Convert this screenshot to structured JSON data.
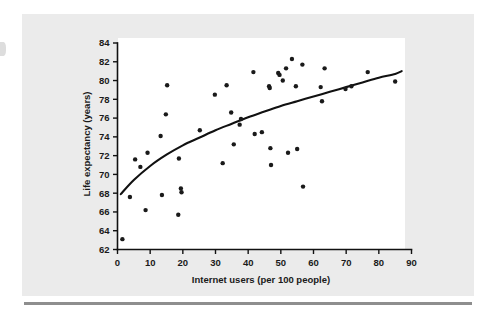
{
  "figure": {
    "background_color": "#ebebeb",
    "plot_background_color": "#ffffff",
    "ink_color": "#1a1a1a",
    "rule_color": "#8e8e8e"
  },
  "chart_data": {
    "type": "scatter",
    "title": "",
    "subtitle": "",
    "xlabel": "Internet users (per 100 people)",
    "ylabel": "Life expectancy (years)",
    "xlim": [
      0,
      90
    ],
    "ylim": [
      62,
      84
    ],
    "xticks": [
      0,
      10,
      20,
      30,
      40,
      50,
      60,
      70,
      80,
      90
    ],
    "yticks": [
      62,
      64,
      66,
      68,
      70,
      72,
      74,
      76,
      78,
      80,
      82,
      84
    ],
    "xtick_labels": [
      "0",
      "10",
      "20",
      "30",
      "40",
      "50",
      "60",
      "70",
      "80",
      "90"
    ],
    "ytick_labels": [
      "62",
      "64",
      "66",
      "68",
      "70",
      "72",
      "74",
      "76",
      "78",
      "80",
      "82",
      "84"
    ],
    "grid": false,
    "legend": null,
    "legend_position": "none",
    "marker": "filled-square-dot",
    "marker_size": 2.2,
    "points": [
      [
        1.5,
        63.1
      ],
      [
        3.8,
        67.6
      ],
      [
        5.4,
        71.6
      ],
      [
        7.0,
        70.8
      ],
      [
        8.6,
        66.2
      ],
      [
        9.2,
        72.3
      ],
      [
        13.2,
        74.1
      ],
      [
        13.6,
        67.8
      ],
      [
        14.8,
        76.4
      ],
      [
        15.2,
        79.5
      ],
      [
        18.6,
        65.7
      ],
      [
        18.8,
        71.7
      ],
      [
        19.4,
        68.5
      ],
      [
        19.6,
        68.1
      ],
      [
        25.2,
        74.7
      ],
      [
        29.8,
        78.5
      ],
      [
        32.2,
        71.2
      ],
      [
        33.4,
        79.5
      ],
      [
        34.8,
        76.6
      ],
      [
        35.6,
        73.2
      ],
      [
        37.4,
        75.3
      ],
      [
        37.8,
        75.9
      ],
      [
        41.6,
        80.9
      ],
      [
        42.0,
        74.3
      ],
      [
        44.2,
        74.5
      ],
      [
        46.4,
        79.4
      ],
      [
        46.6,
        79.2
      ],
      [
        46.8,
        72.8
      ],
      [
        47.0,
        71.0
      ],
      [
        49.2,
        80.8
      ],
      [
        49.6,
        80.6
      ],
      [
        50.6,
        80.0
      ],
      [
        51.6,
        81.3
      ],
      [
        52.2,
        72.3
      ],
      [
        53.4,
        82.3
      ],
      [
        54.6,
        79.4
      ],
      [
        55.0,
        72.7
      ],
      [
        56.6,
        81.7
      ],
      [
        56.8,
        68.7
      ],
      [
        62.2,
        79.3
      ],
      [
        62.6,
        77.8
      ],
      [
        63.4,
        81.3
      ],
      [
        69.8,
        79.1
      ],
      [
        71.6,
        79.4
      ],
      [
        76.6,
        80.9
      ],
      [
        85.0,
        79.9
      ]
    ],
    "trend_line": {
      "label": "fitted logarithmic trend curve",
      "points": [
        [
          1.0,
          67.9
        ],
        [
          5.0,
          69.4
        ],
        [
          10.0,
          70.9
        ],
        [
          15.0,
          72.1
        ],
        [
          20.0,
          73.1
        ],
        [
          25.0,
          73.9
        ],
        [
          30.0,
          74.7
        ],
        [
          35.0,
          75.4
        ],
        [
          40.0,
          76.1
        ],
        [
          45.0,
          76.7
        ],
        [
          50.0,
          77.3
        ],
        [
          55.0,
          77.8
        ],
        [
          60.0,
          78.3
        ],
        [
          65.0,
          78.8
        ],
        [
          70.0,
          79.3
        ],
        [
          75.0,
          79.8
        ],
        [
          80.0,
          80.3
        ],
        [
          85.0,
          80.7
        ],
        [
          87.0,
          81.0
        ]
      ]
    }
  }
}
